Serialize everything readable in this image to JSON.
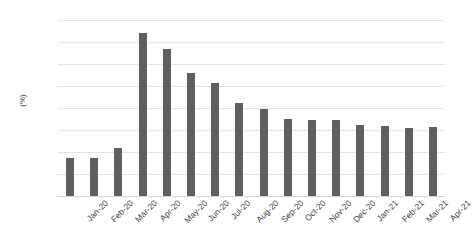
{
  "chart_data": {
    "type": "bar",
    "title": "",
    "xlabel": "",
    "ylabel": "(%)",
    "ylim": [
      0.0,
      16.0
    ],
    "ytick_step": 2.0,
    "ytick_labels": [
      "0.0",
      "2.0",
      "4.0",
      "6.0",
      "8.0",
      "10.0",
      "12.0",
      "14.0",
      "16.0"
    ],
    "ytick_values": [
      0.0,
      2.0,
      4.0,
      6.0,
      8.0,
      10.0,
      12.0,
      14.0,
      16.0
    ],
    "grid": true,
    "legend": false,
    "legend_position": "none",
    "bar_color": "#5f5f5f",
    "gridline_color": "#e3e3e3",
    "text_color": "#3f3f3f",
    "background_color": "#ffffff",
    "categories": [
      "Jan-20",
      "Feb-20",
      "Mar-20",
      "Apr-20",
      "May-20",
      "Jun-20",
      "Jul-20",
      "Aug-20",
      "Sep-20",
      "Oct-20",
      "Nov-20",
      "Dec-20",
      "Jan-21",
      "Feb-21",
      "Mar-21",
      "Apr-21"
    ],
    "values": [
      3.5,
      3.5,
      4.4,
      14.8,
      13.4,
      11.2,
      10.3,
      8.5,
      7.9,
      7.0,
      6.9,
      6.9,
      6.5,
      6.4,
      6.2,
      6.3
    ]
  }
}
